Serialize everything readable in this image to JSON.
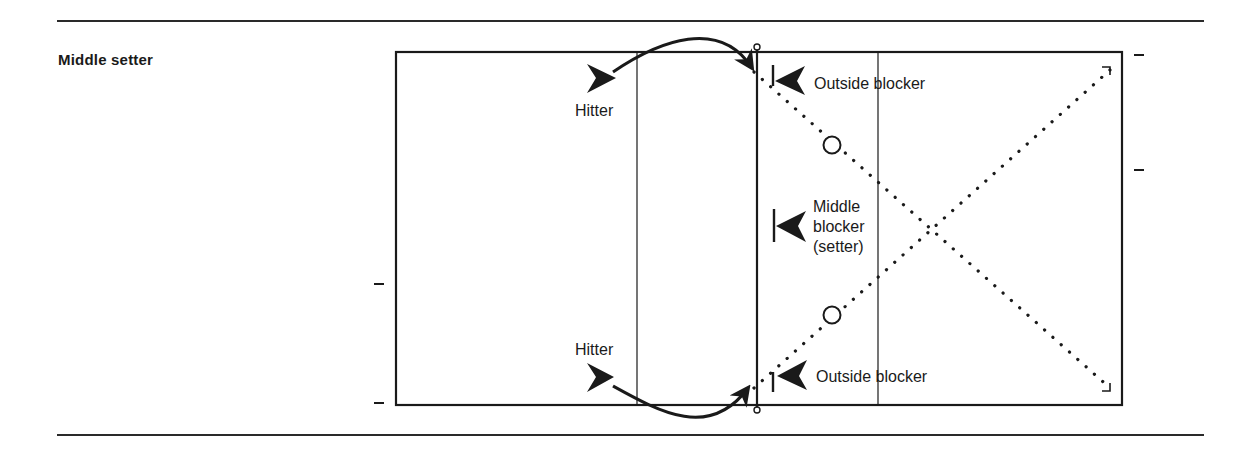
{
  "title": "Middle setter",
  "colors": {
    "ink": "#1a1a1a",
    "background": "#ffffff"
  },
  "labels": {
    "hitter_top": "Hitter",
    "hitter_bottom": "Hitter",
    "outside_blocker_top": "Outside blocker",
    "outside_blocker_bottom": "Outside blocker",
    "middle_blocker_line1": "Middle",
    "middle_blocker_line2": "blocker",
    "middle_blocker_line3": "(setter)"
  },
  "players": [
    {
      "role": "Hitter",
      "side": "left",
      "position": "top",
      "symbol": "arrowhead-right"
    },
    {
      "role": "Hitter",
      "side": "left",
      "position": "bottom",
      "symbol": "arrowhead-right"
    },
    {
      "role": "Outside blocker",
      "side": "right",
      "position": "top",
      "symbol": "blocker-left"
    },
    {
      "role": "Middle blocker (setter)",
      "side": "right",
      "position": "middle",
      "symbol": "blocker-left"
    },
    {
      "role": "Outside blocker",
      "side": "right",
      "position": "bottom",
      "symbol": "blocker-left"
    },
    {
      "role": "Back-row defender",
      "side": "right",
      "position": "upper",
      "symbol": "circle"
    },
    {
      "role": "Back-row defender",
      "side": "right",
      "position": "lower",
      "symbol": "circle"
    }
  ],
  "paths": [
    {
      "type": "attack-arc",
      "from": "Hitter (top)",
      "to": "net top"
    },
    {
      "type": "attack-arc",
      "from": "Hitter (bottom)",
      "to": "net bottom"
    },
    {
      "type": "dotted-diagonal",
      "from": "net top",
      "to": "far bottom corner"
    },
    {
      "type": "dotted-diagonal",
      "from": "net bottom",
      "to": "far top corner"
    }
  ]
}
